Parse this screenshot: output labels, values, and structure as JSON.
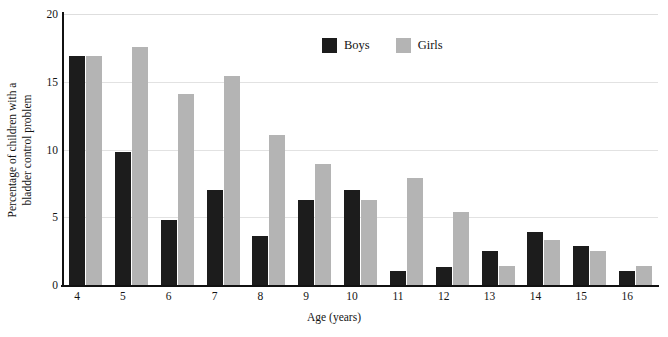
{
  "chart_data": {
    "type": "bar",
    "title": "",
    "xlabel": "Age (years)",
    "ylabel": "Percentage of children with a bladder control problem",
    "ylabel_lines": [
      "Percentage of children with a",
      "bladder control problem"
    ],
    "categories": [
      "4",
      "5",
      "6",
      "7",
      "8",
      "9",
      "10",
      "11",
      "12",
      "13",
      "14",
      "15",
      "16"
    ],
    "series": [
      {
        "name": "Boys",
        "color": "#1c1c1c",
        "values": [
          16.9,
          9.8,
          4.8,
          7.0,
          3.6,
          6.3,
          7.0,
          1.0,
          1.3,
          2.5,
          3.9,
          2.9,
          1.0
        ]
      },
      {
        "name": "Girls",
        "color": "#b4b4b4",
        "values": [
          16.9,
          17.6,
          14.1,
          15.4,
          11.1,
          8.9,
          6.3,
          7.9,
          5.4,
          1.4,
          3.3,
          2.5,
          1.4
        ]
      }
    ],
    "ylim": [
      0,
      20
    ],
    "yticks": [
      0,
      5,
      10,
      15,
      20
    ],
    "ytick_labels": [
      "0",
      "5",
      "10",
      "15",
      "20"
    ],
    "grid": true,
    "grid_axis": "y",
    "legend_position": "top-center",
    "bar_width_px": 16,
    "background": "#ffffff",
    "gridline_color": "#e2e2e2",
    "axis_color": "#111111"
  },
  "legend": {
    "items": [
      {
        "label": "Boys",
        "color": "#1c1c1c"
      },
      {
        "label": "Girls",
        "color": "#b4b4b4"
      }
    ]
  }
}
